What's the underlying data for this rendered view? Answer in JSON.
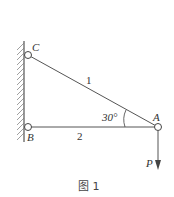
{
  "diagram": {
    "caption": "图 1",
    "nodes": {
      "A": {
        "label": "A"
      },
      "B": {
        "label": "B"
      },
      "C": {
        "label": "C"
      }
    },
    "members": [
      {
        "id": "1",
        "label": "1",
        "from": "C",
        "to": "A"
      },
      {
        "id": "2",
        "label": "2",
        "from": "B",
        "to": "A"
      }
    ],
    "angle": {
      "label": "30°",
      "at": "A",
      "between": [
        "1",
        "2"
      ]
    },
    "load": {
      "label": "P",
      "at": "A",
      "direction": "down"
    },
    "support": "fixed wall (hatched) on left",
    "colors": {
      "line": "#555555",
      "text": "#333333"
    }
  }
}
